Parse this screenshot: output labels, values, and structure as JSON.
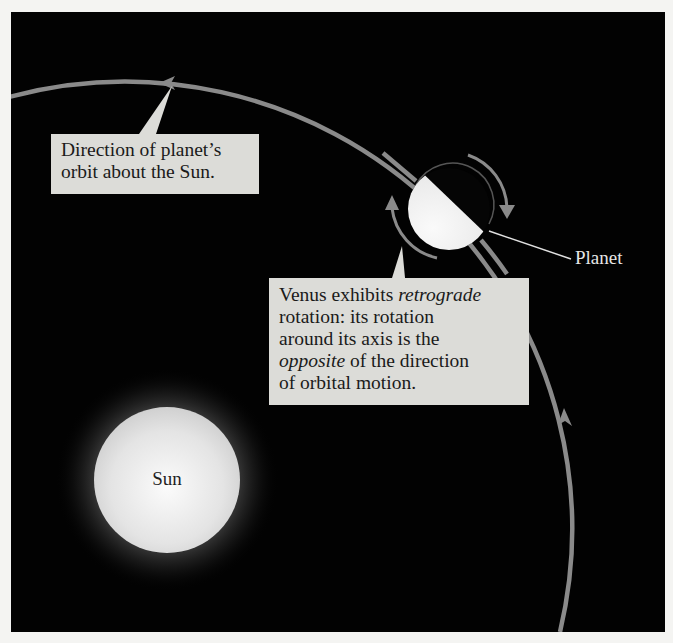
{
  "diagram": {
    "colors": {
      "background": "#020202",
      "orbit": "#8a8a8a",
      "callout_fill": "#dcdcd8",
      "callout_text": "#1a1a1a",
      "label_text": "#e6e6e6",
      "sun_core": "#f2f2f2",
      "planet_lit": "#efefef"
    },
    "callouts": {
      "orbit_direction": {
        "line1": "Direction of planet’s",
        "line2": "orbit about the Sun."
      },
      "retrograde": {
        "line1_a": "Venus exhibits ",
        "line1_em": "retrograde",
        "line2": "rotation: its rotation",
        "line3": "around its axis is the",
        "line4_em": "opposite",
        "line4_b": " of the direction",
        "line5": "of orbital motion."
      }
    },
    "labels": {
      "planet": "Planet",
      "sun": "Sun"
    },
    "icons": {
      "orbit_arrow_top": "arrowhead-left",
      "orbit_arrow_right": "arrowhead-up",
      "rotation_arrow_upper": "curved-arrow-clockwise",
      "rotation_arrow_lower": "curved-arrow-up"
    }
  }
}
